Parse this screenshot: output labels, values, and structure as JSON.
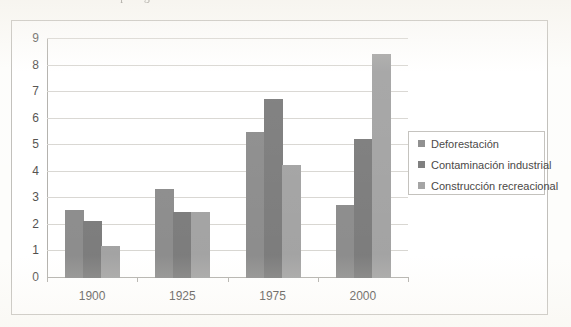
{
  "caption": {
    "text": "conocidas de la zona protegida en los últimos"
  },
  "chart_data": {
    "type": "bar",
    "title": "",
    "subtitle": "",
    "xlabel": "",
    "ylabel": "",
    "categories": [
      "1900",
      "1925",
      "1975",
      "2000"
    ],
    "series": [
      {
        "name": "Deforestación",
        "color": "#808080",
        "values": [
          2.55,
          3.35,
          5.5,
          2.75
        ]
      },
      {
        "name": "Contaminación industrial",
        "color": "#6e6e6e",
        "values": [
          2.15,
          2.5,
          6.75,
          5.25
        ]
      },
      {
        "name": "Construcción recreacional",
        "color": "#999999",
        "values": [
          1.2,
          2.5,
          4.25,
          8.45
        ]
      }
    ],
    "ylim": [
      0,
      9
    ],
    "ytick_labels": [
      "0",
      "1",
      "2",
      "3",
      "4",
      "5",
      "6",
      "7",
      "8",
      "9"
    ],
    "ytick_step": 1,
    "grid": true,
    "grid_axis": "y",
    "legend_position": "right",
    "legend_border": true,
    "plot_border": false,
    "frame_border": true,
    "colors": {
      "gridline": "#d4d2cd",
      "axis": "#a9a7a2",
      "frame": "#b9b7b2",
      "text": "#3d3b38",
      "background": "#ffffff"
    }
  }
}
